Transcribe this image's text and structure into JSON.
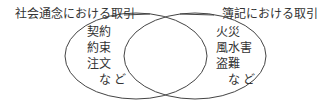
{
  "diagram": {
    "type": "venn",
    "left_set": {
      "label": "社会通念における取引",
      "items": [
        "契約",
        "約束",
        "注文",
        "など"
      ]
    },
    "right_set": {
      "label": "簿記における取引",
      "items": [
        "火災",
        "風水害",
        "盗難",
        "など"
      ]
    },
    "line_color": "#444444"
  }
}
